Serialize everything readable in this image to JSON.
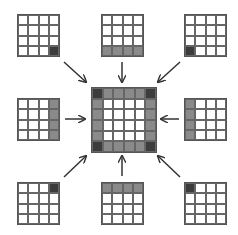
{
  "diagram": {
    "colors": {
      "white": "#ffffff",
      "gray": "#8a8a8a",
      "dark": "#3c3c3c",
      "line": "#555555"
    },
    "center": {
      "position": [
        91,
        87
      ],
      "size": 6,
      "cells": [
        [
          2,
          1,
          1,
          1,
          1,
          2
        ],
        [
          1,
          0,
          0,
          0,
          0,
          1
        ],
        [
          1,
          0,
          0,
          0,
          0,
          1
        ],
        [
          1,
          0,
          0,
          0,
          0,
          1
        ],
        [
          1,
          0,
          0,
          0,
          0,
          1
        ],
        [
          2,
          1,
          1,
          1,
          1,
          2
        ]
      ]
    },
    "outer": [
      {
        "id": "top-left",
        "position": [
          17,
          14
        ],
        "cells": [
          [
            0,
            0,
            0,
            0
          ],
          [
            0,
            0,
            0,
            0
          ],
          [
            0,
            0,
            0,
            0
          ],
          [
            0,
            0,
            0,
            2
          ]
        ]
      },
      {
        "id": "top-middle",
        "position": [
          101,
          14
        ],
        "cells": [
          [
            0,
            0,
            0,
            0
          ],
          [
            0,
            0,
            0,
            0
          ],
          [
            0,
            0,
            0,
            0
          ],
          [
            1,
            1,
            1,
            1
          ]
        ]
      },
      {
        "id": "top-right",
        "position": [
          184,
          14
        ],
        "cells": [
          [
            0,
            0,
            0,
            0
          ],
          [
            0,
            0,
            0,
            0
          ],
          [
            0,
            0,
            0,
            0
          ],
          [
            2,
            0,
            0,
            0
          ]
        ]
      },
      {
        "id": "middle-left",
        "position": [
          17,
          98
        ],
        "cells": [
          [
            0,
            0,
            0,
            1
          ],
          [
            0,
            0,
            0,
            1
          ],
          [
            0,
            0,
            0,
            1
          ],
          [
            0,
            0,
            0,
            1
          ]
        ]
      },
      {
        "id": "middle-right",
        "position": [
          184,
          98
        ],
        "cells": [
          [
            1,
            0,
            0,
            0
          ],
          [
            1,
            0,
            0,
            0
          ],
          [
            1,
            0,
            0,
            0
          ],
          [
            1,
            0,
            0,
            0
          ]
        ]
      },
      {
        "id": "bottom-left",
        "position": [
          17,
          182
        ],
        "cells": [
          [
            0,
            0,
            0,
            2
          ],
          [
            0,
            0,
            0,
            0
          ],
          [
            0,
            0,
            0,
            0
          ],
          [
            0,
            0,
            0,
            0
          ]
        ]
      },
      {
        "id": "bottom-middle",
        "position": [
          101,
          182
        ],
        "cells": [
          [
            1,
            1,
            1,
            1
          ],
          [
            0,
            0,
            0,
            0
          ],
          [
            0,
            0,
            0,
            0
          ],
          [
            0,
            0,
            0,
            0
          ]
        ]
      },
      {
        "id": "bottom-right",
        "position": [
          184,
          182
        ],
        "cells": [
          [
            2,
            0,
            0,
            0
          ],
          [
            0,
            0,
            0,
            0
          ],
          [
            0,
            0,
            0,
            0
          ],
          [
            0,
            0,
            0,
            0
          ]
        ]
      }
    ],
    "arrows": [
      {
        "from": "top-left",
        "x1": 64,
        "y1": 62,
        "x2": 86,
        "y2": 82
      },
      {
        "from": "top-middle",
        "x1": 122,
        "y1": 62,
        "x2": 122,
        "y2": 82
      },
      {
        "from": "top-right",
        "x1": 180,
        "y1": 62,
        "x2": 158,
        "y2": 82
      },
      {
        "from": "middle-left",
        "x1": 65,
        "y1": 119,
        "x2": 85,
        "y2": 119
      },
      {
        "from": "middle-right",
        "x1": 179,
        "y1": 119,
        "x2": 161,
        "y2": 119
      },
      {
        "from": "bottom-left",
        "x1": 64,
        "y1": 177,
        "x2": 86,
        "y2": 156
      },
      {
        "from": "bottom-middle",
        "x1": 122,
        "y1": 176,
        "x2": 122,
        "y2": 156
      },
      {
        "from": "bottom-right",
        "x1": 180,
        "y1": 177,
        "x2": 158,
        "y2": 156
      }
    ]
  }
}
